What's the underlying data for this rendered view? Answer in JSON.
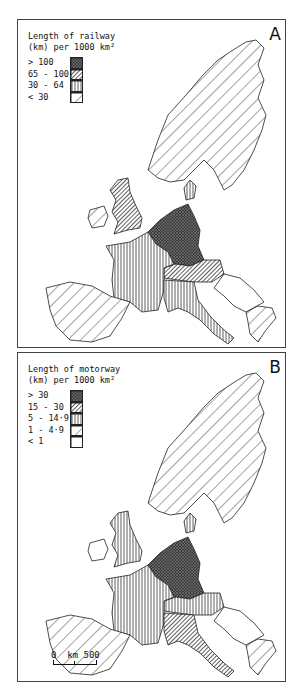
{
  "panels": [
    {
      "label": "A",
      "legend": {
        "title_line1": "Length of railway",
        "title_line2": "(km) per 1000 km²",
        "classes": [
          {
            "label": "> 100",
            "pattern": "crosshatch-dark"
          },
          {
            "label": "65 - 100",
            "pattern": "dense-diagonal"
          },
          {
            "label": "30 - 64",
            "pattern": "vertical"
          },
          {
            "label": "< 30",
            "pattern": "sparse-diagonal"
          }
        ]
      },
      "regions": {
        "scandinavia": "sparse-diagonal",
        "uk": "dense-diagonal",
        "ireland": "sparse-diagonal",
        "benelux_germany": "crosshatch-dark",
        "switzerland_austria": "dense-diagonal",
        "france": "vertical",
        "italy": "vertical",
        "iberia": "sparse-diagonal",
        "greece": "sparse-diagonal",
        "denmark": "vertical"
      }
    },
    {
      "label": "B",
      "legend": {
        "title_line1": "Length of motorway",
        "title_line2": "(km) per 1000 km²",
        "classes": [
          {
            "label": "> 30",
            "pattern": "crosshatch-dark"
          },
          {
            "label": "15 - 30",
            "pattern": "dense-diagonal"
          },
          {
            "label": "5 - 14·9",
            "pattern": "vertical"
          },
          {
            "label": "1 - 4·9",
            "pattern": "sparse-diagonal"
          },
          {
            "label": "< 1",
            "pattern": "blank"
          }
        ]
      },
      "regions": {
        "scandinavia": "sparse-diagonal",
        "uk": "vertical",
        "ireland": "blank",
        "benelux_germany": "crosshatch-dark",
        "switzerland_austria": "vertical",
        "france": "vertical",
        "italy": "dense-diagonal",
        "iberia": "sparse-diagonal",
        "greece": "sparse-diagonal",
        "denmark": "vertical"
      },
      "scale": {
        "start": "0",
        "unit": "km",
        "end": "500"
      }
    }
  ],
  "colors": {
    "ink": "#222222",
    "background": "#ffffff",
    "dark_fill": "#555555"
  }
}
